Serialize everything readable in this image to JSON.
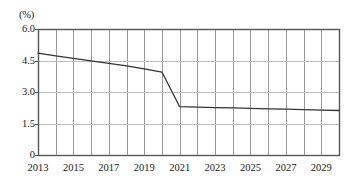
{
  "chart_data": {
    "type": "line",
    "title": "",
    "subtitle": "",
    "xlabel": "",
    "ylabel": "",
    "unit_label": "(%)",
    "xlim": [
      2013,
      2030
    ],
    "ylim": [
      0,
      6.0
    ],
    "yticks": [
      "0",
      "1.5",
      "3.0",
      "4.5",
      "6.0"
    ],
    "ytick_values": [
      0,
      1.5,
      3.0,
      4.5,
      6.0
    ],
    "xticks": [
      "2013",
      "2015",
      "2017",
      "2019",
      "2021",
      "2023",
      "2025",
      "2027",
      "2029"
    ],
    "xtick_values": [
      2013,
      2015,
      2017,
      2019,
      2021,
      2023,
      2025,
      2027,
      2029
    ],
    "grid": "both",
    "grid_x_step": 1,
    "legend": "none",
    "series": [
      {
        "name": "rate",
        "color": "#333333",
        "x": [
          2013,
          2014,
          2015,
          2016,
          2017,
          2018,
          2019,
          2020,
          2021,
          2022,
          2023,
          2024,
          2025,
          2026,
          2027,
          2028,
          2029,
          2030
        ],
        "values": [
          4.85,
          4.72,
          4.6,
          4.48,
          4.36,
          4.24,
          4.1,
          3.95,
          2.3,
          2.28,
          2.26,
          2.24,
          2.22,
          2.2,
          2.18,
          2.16,
          2.14,
          2.12
        ]
      }
    ]
  },
  "colors": {
    "line": "#333333",
    "grid": "#9a9a9a",
    "grid_light": "#bdbdbd",
    "axis": "#555555",
    "background": "#ffffff",
    "text": "#1a1a1a"
  },
  "plot_box": {
    "left": 38,
    "top": 29,
    "right": 339,
    "bottom": 155
  }
}
